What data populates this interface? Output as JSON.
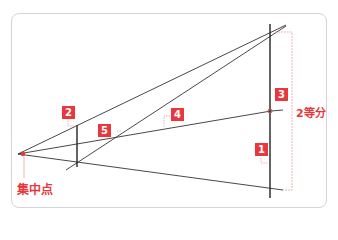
{
  "colors": {
    "accent": "#e8383d",
    "line": "#333333",
    "frame": "#d4d4d4",
    "guide": "#f19a9d"
  },
  "labels": {
    "vanishing_point": "集中点",
    "bisect": "2等分"
  },
  "badges": [
    {
      "id": "1",
      "text": "1"
    },
    {
      "id": "2",
      "text": "2"
    },
    {
      "id": "3",
      "text": "3"
    },
    {
      "id": "4",
      "text": "4"
    },
    {
      "id": "5",
      "text": "5"
    }
  ]
}
